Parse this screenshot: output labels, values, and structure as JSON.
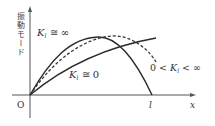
{
  "diagram": {
    "y_axis_label": "振動モード",
    "x_axis_label": "x",
    "origin_label": "O",
    "length_label": "l",
    "curves": [
      {
        "name": "K_l ≅ ∞",
        "style": "solid",
        "description": "rises from origin, peaks before mid-span, returns to zero at x = l"
      },
      {
        "name": "0 < K_l < ∞",
        "style": "dashed",
        "description": "rises from origin, peaks later, ends at nonzero value at x = l"
      },
      {
        "name": "K_l ≅ 0",
        "style": "solid",
        "description": "rises monotonically from origin, maximum at x = l"
      }
    ],
    "labels": {
      "inf_K": "K",
      "inf_sub": "l",
      "inf_rest": " ≅ ∞",
      "zero_K": "K",
      "zero_sub": "l",
      "zero_rest": " ≅ 0",
      "mid_pre": "0 < ",
      "mid_K": "K",
      "mid_sub": "l",
      "mid_rest": " < ∞"
    }
  }
}
